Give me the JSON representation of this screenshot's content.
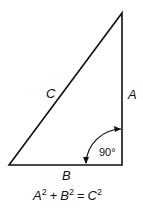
{
  "diagram": {
    "labels": {
      "hypotenuse": "C",
      "vertical_side": "A",
      "base": "B",
      "angle": "90°"
    },
    "equation": {
      "a": "A",
      "b": "B",
      "c": "C",
      "exp": "2",
      "plus": "+",
      "equals": "="
    },
    "colors": {
      "stroke": "#111111",
      "background": "#ffffff"
    }
  }
}
